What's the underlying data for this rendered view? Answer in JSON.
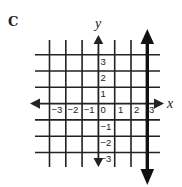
{
  "figure": {
    "panel_label": "C",
    "x_axis_label": "x",
    "y_axis_label": "y",
    "x_ticks": [
      "−3",
      "−2",
      "−1",
      "0",
      "1",
      "2",
      "3"
    ],
    "y_ticks_positive": [
      "3",
      "2",
      "1"
    ],
    "y_ticks_negative": [
      "−1",
      "−2",
      "−3"
    ],
    "highlighted_line": {
      "equation": "x = 3",
      "style": "thick vertical line with arrows at both ends"
    },
    "colors": {
      "ink": "#222222",
      "background": "#ffffff"
    }
  }
}
